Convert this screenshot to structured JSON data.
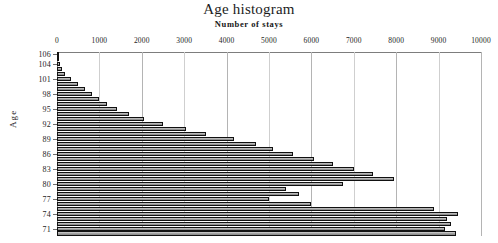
{
  "chart_data": {
    "type": "bar",
    "orientation": "horizontal",
    "title": "Age histogram",
    "subtitle": "Number of stays",
    "xlabel": "Number of stays",
    "ylabel": "Age",
    "xlim": [
      0,
      10000
    ],
    "xticks": [
      0,
      1000,
      2000,
      3000,
      4000,
      5000,
      6000,
      7000,
      8000,
      9000,
      10000
    ],
    "xtick_labels": [
      "0",
      "1000",
      "2000",
      "3000",
      "4000",
      "5000",
      "6000",
      "7000",
      "8000",
      "9000",
      "10000"
    ],
    "xaxis_position": "top",
    "grid": true,
    "grid_axis": "x",
    "legend": false,
    "ytick_labels": [
      "106",
      "104",
      "101",
      "98",
      "95",
      "92",
      "89",
      "86",
      "83",
      "80",
      "77",
      "74",
      "71"
    ],
    "ytick_values": [
      106,
      104,
      101,
      98,
      95,
      92,
      89,
      86,
      83,
      80,
      77,
      74,
      71
    ],
    "categories": [
      106,
      105,
      104,
      103,
      102,
      101,
      100,
      99,
      98,
      97,
      96,
      95,
      94,
      93,
      92,
      91,
      90,
      89,
      88,
      87,
      86,
      85,
      84,
      83,
      82,
      81,
      80,
      79,
      78,
      77,
      76,
      75,
      74,
      73,
      72,
      71,
      70
    ],
    "values": [
      20,
      30,
      60,
      110,
      200,
      330,
      500,
      660,
      830,
      1000,
      1180,
      1420,
      1700,
      2060,
      2500,
      3050,
      3520,
      4180,
      4700,
      5100,
      5560,
      6050,
      6500,
      7000,
      7450,
      7950,
      6750,
      5400,
      5700,
      5000,
      6000,
      8900,
      9450,
      9200,
      9300,
      9150,
      9400
    ],
    "bar_color": "#9d9d9d",
    "bar_edge_color": "#111111"
  },
  "axis": {
    "y_title": "Age"
  }
}
